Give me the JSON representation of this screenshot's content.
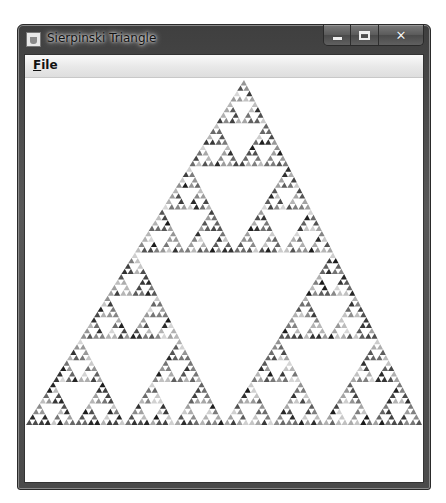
{
  "window": {
    "title": "Sierpinski Triangle",
    "icon": "java-cup-icon",
    "caption_buttons": {
      "minimize": "minimize-icon",
      "maximize": "maximize-icon",
      "close": "close-icon"
    }
  },
  "menubar": {
    "items": [
      {
        "label": "File",
        "mnemonic": "F",
        "rest": "ile"
      }
    ]
  },
  "canvas": {
    "shape": "sierpinski-triangle",
    "depth": 6,
    "apex": [
      219,
      2
    ],
    "base_left": [
      1,
      347
    ],
    "base_right": [
      397,
      347
    ],
    "fill_style": "random-gray",
    "gray_range": [
      "#1a1a1a",
      "#d8d8d8"
    ],
    "background": "#ffffff"
  }
}
